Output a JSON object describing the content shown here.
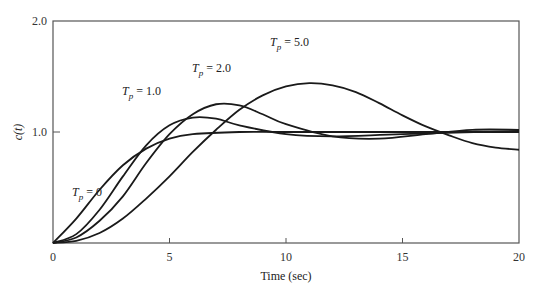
{
  "chart_data": {
    "type": "line",
    "title": "",
    "xlabel": "Time (sec)",
    "ylabel": "c(t)",
    "xlim": [
      0,
      20
    ],
    "ylim": [
      0,
      2.0
    ],
    "x_ticks": [
      "0",
      "5",
      "10",
      "15",
      "20"
    ],
    "y_ticks": [
      "1.0",
      "2.0"
    ],
    "grid": false,
    "legend": "inline annotations",
    "series": [
      {
        "name": "T_p = 0",
        "label_main": "T",
        "label_sub": "p",
        "label_rest": " = 0",
        "points": [
          [
            0,
            0
          ],
          [
            1,
            0.22
          ],
          [
            2,
            0.48
          ],
          [
            3,
            0.7
          ],
          [
            4,
            0.85
          ],
          [
            5,
            0.94
          ],
          [
            6,
            0.98
          ],
          [
            8,
            1.0
          ],
          [
            10,
            1.0
          ],
          [
            15,
            1.0
          ],
          [
            20,
            1.0
          ]
        ]
      },
      {
        "name": "T_p = 1.0",
        "label_main": "T",
        "label_sub": "p",
        "label_rest": " = 1.0",
        "points": [
          [
            0,
            0
          ],
          [
            1,
            0.08
          ],
          [
            2,
            0.3
          ],
          [
            3,
            0.6
          ],
          [
            4,
            0.88
          ],
          [
            5,
            1.06
          ],
          [
            6,
            1.13
          ],
          [
            7,
            1.12
          ],
          [
            8,
            1.06
          ],
          [
            10,
            0.98
          ],
          [
            12,
            0.96
          ],
          [
            15,
            0.98
          ],
          [
            20,
            1.01
          ]
        ]
      },
      {
        "name": "T_p = 2.0",
        "label_main": "T",
        "label_sub": "p",
        "label_rest": " = 2.0",
        "points": [
          [
            0,
            0
          ],
          [
            1,
            0.05
          ],
          [
            2,
            0.2
          ],
          [
            3,
            0.42
          ],
          [
            4,
            0.72
          ],
          [
            5,
            0.98
          ],
          [
            6,
            1.16
          ],
          [
            7,
            1.25
          ],
          [
            8,
            1.24
          ],
          [
            9,
            1.16
          ],
          [
            10,
            1.07
          ],
          [
            12,
            0.96
          ],
          [
            14,
            0.94
          ],
          [
            16,
            0.98
          ],
          [
            18,
            1.02
          ],
          [
            20,
            1.02
          ]
        ]
      },
      {
        "name": "T_p = 5.0",
        "label_main": "T",
        "label_sub": "p",
        "label_rest": " = 5.0",
        "points": [
          [
            0,
            0
          ],
          [
            1,
            0.02
          ],
          [
            2,
            0.09
          ],
          [
            3,
            0.22
          ],
          [
            4,
            0.4
          ],
          [
            5,
            0.6
          ],
          [
            6,
            0.82
          ],
          [
            7,
            1.02
          ],
          [
            8,
            1.2
          ],
          [
            9,
            1.33
          ],
          [
            10,
            1.41
          ],
          [
            11,
            1.44
          ],
          [
            12,
            1.42
          ],
          [
            13,
            1.36
          ],
          [
            14,
            1.26
          ],
          [
            15,
            1.15
          ],
          [
            16,
            1.05
          ],
          [
            17,
            0.97
          ],
          [
            18,
            0.9
          ],
          [
            19,
            0.86
          ],
          [
            20,
            0.84
          ]
        ]
      }
    ]
  }
}
